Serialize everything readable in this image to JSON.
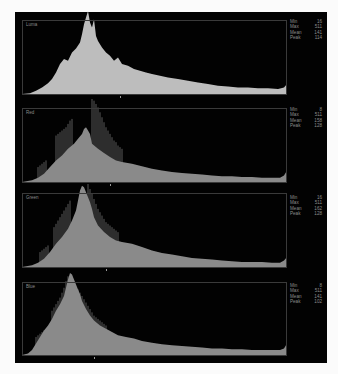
{
  "chart_data": [
    {
      "type": "area",
      "title": "Luma",
      "xlim": [
        0,
        511
      ],
      "stats": {
        "min": 16,
        "max": 511,
        "mean": 141,
        "peak": 114
      },
      "color": "#bdbdbd",
      "shape_points": [
        [
          0,
          0
        ],
        [
          8,
          1
        ],
        [
          14,
          4
        ],
        [
          20,
          8
        ],
        [
          26,
          13
        ],
        [
          30,
          18
        ],
        [
          34,
          26
        ],
        [
          38,
          36
        ],
        [
          42,
          42
        ],
        [
          46,
          40
        ],
        [
          50,
          50
        ],
        [
          54,
          55
        ],
        [
          58,
          62
        ],
        [
          60,
          72
        ],
        [
          62,
          84
        ],
        [
          64,
          92
        ],
        [
          66,
          100
        ],
        [
          68,
          86
        ],
        [
          70,
          80
        ],
        [
          72,
          90
        ],
        [
          74,
          70
        ],
        [
          76,
          64
        ],
        [
          80,
          56
        ],
        [
          84,
          50
        ],
        [
          88,
          46
        ],
        [
          92,
          40
        ],
        [
          96,
          44
        ],
        [
          100,
          36
        ],
        [
          106,
          34
        ],
        [
          112,
          30
        ],
        [
          118,
          28
        ],
        [
          124,
          26
        ],
        [
          130,
          24
        ],
        [
          138,
          22
        ],
        [
          146,
          20
        ],
        [
          156,
          18
        ],
        [
          166,
          16
        ],
        [
          176,
          14
        ],
        [
          186,
          12
        ],
        [
          196,
          10
        ],
        [
          206,
          9
        ],
        [
          216,
          8
        ],
        [
          226,
          8
        ],
        [
          236,
          7
        ],
        [
          246,
          7
        ],
        [
          256,
          6
        ],
        [
          262,
          8
        ],
        [
          265,
          12
        ]
      ]
    },
    {
      "type": "area",
      "title": "Red",
      "xlim": [
        0,
        511
      ],
      "stats": {
        "min": 8,
        "max": 511,
        "mean": 158,
        "peak": 128
      },
      "color": "#8a8a8a",
      "shape_points": [
        [
          0,
          0
        ],
        [
          10,
          2
        ],
        [
          16,
          5
        ],
        [
          22,
          10
        ],
        [
          28,
          18
        ],
        [
          34,
          26
        ],
        [
          40,
          32
        ],
        [
          46,
          40
        ],
        [
          52,
          46
        ],
        [
          56,
          52
        ],
        [
          60,
          58
        ],
        [
          62,
          64
        ],
        [
          64,
          66
        ],
        [
          66,
          62
        ],
        [
          68,
          58
        ],
        [
          70,
          46
        ],
        [
          76,
          40
        ],
        [
          82,
          35
        ],
        [
          88,
          30
        ],
        [
          94,
          26
        ],
        [
          100,
          24
        ],
        [
          110,
          22
        ],
        [
          120,
          19
        ],
        [
          130,
          16
        ],
        [
          140,
          14
        ],
        [
          150,
          12
        ],
        [
          160,
          11
        ],
        [
          170,
          10
        ],
        [
          180,
          9
        ],
        [
          190,
          8
        ],
        [
          200,
          7
        ],
        [
          210,
          7
        ],
        [
          220,
          6
        ],
        [
          230,
          6
        ],
        [
          240,
          5
        ],
        [
          250,
          5
        ],
        [
          258,
          5
        ],
        [
          262,
          8
        ],
        [
          265,
          14
        ]
      ],
      "spikes_x": [
        16,
        18,
        20,
        22,
        24,
        34,
        36,
        38,
        40,
        42,
        44,
        46,
        48,
        50,
        70,
        72,
        74,
        76,
        78,
        80,
        82,
        84,
        86,
        88,
        90,
        92,
        94,
        96,
        98,
        100
      ],
      "spikes_h": [
        18,
        20,
        22,
        24,
        26,
        56,
        58,
        60,
        62,
        64,
        66,
        70,
        74,
        76,
        100,
        98,
        94,
        90,
        84,
        78,
        72,
        66,
        62,
        58,
        54,
        50,
        48,
        44,
        42,
        40
      ]
    },
    {
      "type": "area",
      "title": "Green",
      "xlim": [
        0,
        511
      ],
      "stats": {
        "min": 16,
        "max": 511,
        "mean": 162,
        "peak": 128
      },
      "color": "#8a8a8a",
      "shape_points": [
        [
          0,
          0
        ],
        [
          10,
          2
        ],
        [
          16,
          5
        ],
        [
          22,
          10
        ],
        [
          28,
          18
        ],
        [
          34,
          28
        ],
        [
          40,
          36
        ],
        [
          46,
          46
        ],
        [
          50,
          56
        ],
        [
          54,
          68
        ],
        [
          56,
          80
        ],
        [
          58,
          92
        ],
        [
          60,
          98
        ],
        [
          62,
          96
        ],
        [
          64,
          90
        ],
        [
          66,
          84
        ],
        [
          68,
          78
        ],
        [
          70,
          70
        ],
        [
          72,
          60
        ],
        [
          76,
          50
        ],
        [
          82,
          42
        ],
        [
          88,
          36
        ],
        [
          94,
          32
        ],
        [
          100,
          30
        ],
        [
          110,
          28
        ],
        [
          120,
          24
        ],
        [
          130,
          20
        ],
        [
          140,
          17
        ],
        [
          150,
          15
        ],
        [
          160,
          13
        ],
        [
          170,
          11
        ],
        [
          180,
          10
        ],
        [
          190,
          9
        ],
        [
          200,
          8
        ],
        [
          210,
          7
        ],
        [
          220,
          6
        ],
        [
          230,
          6
        ],
        [
          240,
          6
        ],
        [
          250,
          5
        ],
        [
          258,
          5
        ],
        [
          262,
          8
        ],
        [
          265,
          12
        ]
      ],
      "spikes_x": [
        18,
        20,
        22,
        24,
        26,
        32,
        34,
        36,
        38,
        40,
        42,
        44,
        46,
        48,
        66,
        68,
        70,
        72,
        74,
        76,
        78,
        80,
        82,
        84,
        86,
        88,
        90,
        92,
        94,
        96
      ],
      "spikes_h": [
        18,
        20,
        22,
        24,
        26,
        48,
        52,
        56,
        60,
        64,
        68,
        72,
        76,
        80,
        100,
        94,
        88,
        82,
        76,
        70,
        66,
        62,
        58,
        54,
        52,
        50,
        48,
        46,
        44,
        42
      ]
    },
    {
      "type": "area",
      "title": "Blue",
      "xlim": [
        0,
        511
      ],
      "stats": {
        "min": 8,
        "max": 511,
        "mean": 141,
        "peak": 102
      },
      "color": "#8a8a8a",
      "shape_points": [
        [
          0,
          0
        ],
        [
          6,
          2
        ],
        [
          10,
          6
        ],
        [
          14,
          14
        ],
        [
          18,
          22
        ],
        [
          22,
          30
        ],
        [
          26,
          36
        ],
        [
          30,
          44
        ],
        [
          34,
          54
        ],
        [
          38,
          62
        ],
        [
          42,
          72
        ],
        [
          44,
          82
        ],
        [
          46,
          92
        ],
        [
          48,
          100
        ],
        [
          50,
          98
        ],
        [
          52,
          92
        ],
        [
          54,
          86
        ],
        [
          56,
          80
        ],
        [
          58,
          74
        ],
        [
          60,
          66
        ],
        [
          64,
          56
        ],
        [
          68,
          48
        ],
        [
          72,
          42
        ],
        [
          78,
          36
        ],
        [
          84,
          32
        ],
        [
          90,
          28
        ],
        [
          96,
          24
        ],
        [
          104,
          22
        ],
        [
          112,
          20
        ],
        [
          120,
          17
        ],
        [
          130,
          15
        ],
        [
          140,
          13
        ],
        [
          150,
          12
        ],
        [
          160,
          11
        ],
        [
          170,
          10
        ],
        [
          180,
          9
        ],
        [
          190,
          8
        ],
        [
          200,
          8
        ],
        [
          210,
          7
        ],
        [
          220,
          7
        ],
        [
          230,
          6
        ],
        [
          240,
          6
        ],
        [
          250,
          6
        ],
        [
          258,
          6
        ],
        [
          262,
          8
        ],
        [
          265,
          14
        ]
      ],
      "spikes_x": [
        14,
        16,
        18,
        20,
        22,
        30,
        32,
        34,
        36,
        38,
        40,
        42,
        44,
        46,
        56,
        58,
        60,
        62,
        64,
        66,
        68,
        70,
        72,
        74,
        76,
        78,
        80,
        82,
        84
      ],
      "spikes_h": [
        22,
        24,
        26,
        28,
        30,
        54,
        58,
        62,
        66,
        70,
        76,
        82,
        90,
        96,
        80,
        76,
        72,
        68,
        64,
        60,
        56,
        52,
        48,
        46,
        44,
        42,
        40,
        38,
        36
      ]
    }
  ],
  "panels": [
    {
      "label": "Luma",
      "stats": [
        {
          "k": "Min",
          "v": "16"
        },
        {
          "k": "Max",
          "v": "511"
        },
        {
          "k": "Mean",
          "v": "141"
        },
        {
          "k": "Peak",
          "v": "114"
        }
      ]
    },
    {
      "label": "Red",
      "stats": [
        {
          "k": "Min",
          "v": "8"
        },
        {
          "k": "Max",
          "v": "511"
        },
        {
          "k": "Mean",
          "v": "158"
        },
        {
          "k": "Peak",
          "v": "128"
        }
      ]
    },
    {
      "label": "Green",
      "stats": [
        {
          "k": "Min",
          "v": "16"
        },
        {
          "k": "Max",
          "v": "511"
        },
        {
          "k": "Mean",
          "v": "162"
        },
        {
          "k": "Peak",
          "v": "128"
        }
      ]
    },
    {
      "label": "Blue",
      "stats": [
        {
          "k": "Min",
          "v": "8"
        },
        {
          "k": "Max",
          "v": "511"
        },
        {
          "k": "Mean",
          "v": "141"
        },
        {
          "k": "Peak",
          "v": "102"
        }
      ]
    }
  ]
}
